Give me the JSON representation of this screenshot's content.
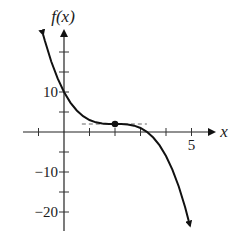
{
  "chart_data": {
    "type": "line",
    "title": "",
    "xlabel": "x",
    "ylabel": "f(x)",
    "function": "f(x) = -(x-2)^3 + 2",
    "xlim": [
      -1.6,
      5.9
    ],
    "ylim": [
      -24.5,
      25
    ],
    "grid": false,
    "legend": null,
    "x_ticks": [
      -1,
      1,
      2,
      3,
      4,
      5
    ],
    "x_tick_labels": [
      {
        "value": 5,
        "label": "5"
      }
    ],
    "y_ticks": [
      -20,
      -15,
      -10,
      -5,
      5,
      10,
      15,
      20
    ],
    "y_tick_labels": [
      {
        "value": 10,
        "label": "10"
      },
      {
        "value": -10,
        "label": "−10"
      },
      {
        "value": -20,
        "label": "−20"
      }
    ],
    "series": [
      {
        "name": "f(x)",
        "color": "#111111",
        "x": [
          -0.82,
          -0.75,
          -0.5,
          -0.25,
          0,
          0.25,
          0.5,
          0.75,
          1,
          1.25,
          1.5,
          1.75,
          2,
          2.25,
          2.5,
          2.75,
          3,
          3.25,
          3.5,
          3.75,
          4,
          4.25,
          4.5,
          4.75,
          4.94
        ],
        "y": [
          24.4,
          22.8,
          17.63,
          13.39,
          10,
          7.36,
          5.38,
          3.95,
          3,
          2.42,
          2.13,
          2.02,
          2,
          1.98,
          1.88,
          1.58,
          1,
          0.05,
          -1.38,
          -3.36,
          -6,
          -9.39,
          -13.63,
          -18.8,
          -23.41
        ],
        "arrow_start": true,
        "arrow_end": true
      }
    ],
    "annotations": [
      {
        "type": "point",
        "x": 2,
        "y": 2,
        "label": "critical point (2, 2)"
      },
      {
        "type": "dashed_tangent",
        "y": 2,
        "x_from": 0.7,
        "x_to": 3.25
      }
    ]
  },
  "labels": {
    "y_axis": "f(x)",
    "x_axis": "x"
  }
}
